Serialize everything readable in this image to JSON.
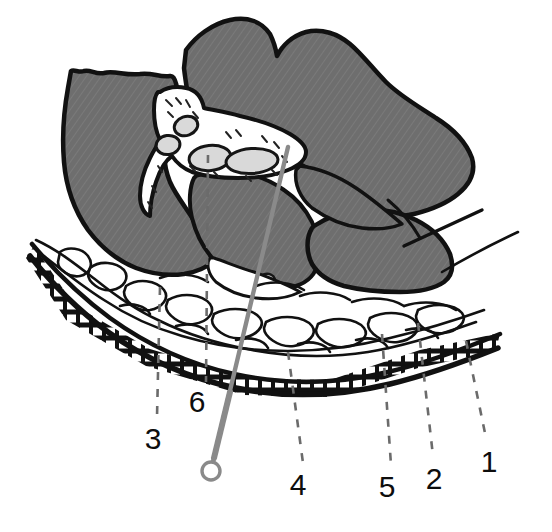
{
  "figure": {
    "kind": "anatomical-cross-section-diagram",
    "title": "",
    "background_color": "#ffffff",
    "colors": {
      "tissue_gray": "#6e6e6e",
      "tissue_gray_hatch": "#787878",
      "outline_black": "#111111",
      "vessel_lumen": "#d9d9d9",
      "vessel_outline": "#151515",
      "connective_white": "#ffffff",
      "needle_gray": "#8a8a8a",
      "leader_dash": "#6b6b6b",
      "label_text": "#0d0d0d"
    }
  },
  "labels": [
    {
      "id": "label-1",
      "text": "1",
      "x": 489,
      "y": 472,
      "leader": {
        "x1": 466,
        "y1": 341,
        "x2": 486,
        "y2": 438
      }
    },
    {
      "id": "label-2",
      "text": "2",
      "x": 434,
      "y": 489,
      "leader": {
        "x1": 418,
        "y1": 323,
        "x2": 433,
        "y2": 456
      }
    },
    {
      "id": "label-3",
      "text": "3",
      "x": 153,
      "y": 449,
      "leader": {
        "x1": 160,
        "y1": 287,
        "x2": 157,
        "y2": 417
      }
    },
    {
      "id": "label-4",
      "text": "4",
      "x": 298,
      "y": 495,
      "leader": {
        "x1": 288,
        "y1": 352,
        "x2": 303,
        "y2": 463
      }
    },
    {
      "id": "label-5",
      "text": "5",
      "x": 387,
      "y": 497,
      "leader": {
        "x1": 382,
        "y1": 334,
        "x2": 391,
        "y2": 465
      }
    },
    {
      "id": "label-6",
      "text": "6",
      "x": 197,
      "y": 412,
      "leader": {
        "x1": 208,
        "y1": 155,
        "x2": 206,
        "y2": 382
      }
    }
  ],
  "needle": {
    "name": "needle-probe",
    "tip": {
      "x": 288,
      "y": 147
    },
    "handle_ring": {
      "cx": 211,
      "cy": 471,
      "r": 9
    },
    "shaft_color": "#8a8a8a"
  },
  "vessels": [
    {
      "name": "vessel-small-upper",
      "cx": 186,
      "cy": 126,
      "rx": 11,
      "ry": 9,
      "rot": -20
    },
    {
      "name": "vessel-small-left",
      "cx": 169,
      "cy": 144,
      "rx": 11,
      "ry": 9,
      "rot": -10
    },
    {
      "name": "vessel-mid",
      "cx": 209,
      "cy": 157,
      "rx": 20,
      "ry": 12,
      "rot": -8
    },
    {
      "name": "vessel-large-right",
      "cx": 249,
      "cy": 160,
      "rx": 25,
      "ry": 12,
      "rot": -5
    },
    {
      "name": "vessel-lower-small",
      "cx": 266,
      "cy": 281,
      "rx": 8,
      "ry": 6,
      "rot": -15
    }
  ],
  "structures": [
    {
      "name": "upper-left-muscle-mass",
      "type": "gray-tissue"
    },
    {
      "name": "upper-right-muscle-mass",
      "type": "gray-tissue"
    },
    {
      "name": "lower-right-muscle-mass",
      "type": "gray-tissue"
    },
    {
      "name": "central-muscle-mass",
      "type": "gray-tissue"
    },
    {
      "name": "connective-tissue-septum",
      "type": "white-fibrous"
    },
    {
      "name": "submucosa-layer",
      "type": "white-fibrous"
    },
    {
      "name": "epithelium-band",
      "type": "brick-pattern"
    },
    {
      "name": "fascial-strand-upper-right",
      "type": "thin-line"
    },
    {
      "name": "fascial-strand-lower-right",
      "type": "thin-line"
    }
  ]
}
